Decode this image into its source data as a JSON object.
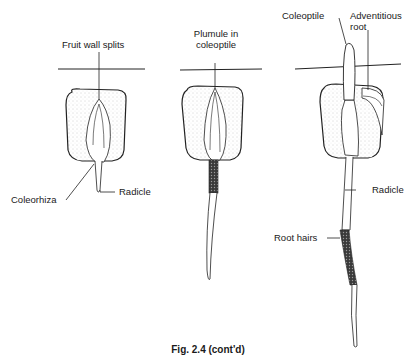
{
  "figure": {
    "caption": "Fig. 2.4  (cont'd)",
    "stages": [
      {
        "id": "stage-1",
        "labels": {
          "fruit_wall": "Fruit wall splits",
          "coleorhiza": "Coleorhiza",
          "radicle": "Radicle"
        }
      },
      {
        "id": "stage-2",
        "labels": {
          "plumule": "Plumule in coleoptile",
          "plumule_line1": "Plumule in",
          "plumule_line2": "coleoptile"
        }
      },
      {
        "id": "stage-3",
        "labels": {
          "coleoptile": "Coleoptile",
          "adventitious_line1": "Adventitious",
          "adventitious_line2": "root",
          "radicle": "Radicle",
          "root_hairs": "Root hairs"
        }
      }
    ]
  }
}
